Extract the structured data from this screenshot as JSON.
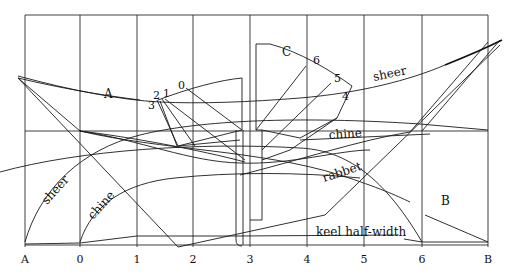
{
  "diagram": {
    "type": "boat lines drawing (half-breadth and body plan)",
    "stations": [
      "A",
      "0",
      "1",
      "2",
      "3",
      "4",
      "5",
      "6",
      "B"
    ],
    "curve_labels": {
      "sheer_upper": "sheer",
      "sheer_lower": "sheer",
      "chine_upper": "chine",
      "chine_lower": "chine",
      "rabbet": "rabbet",
      "keel_half_width": "keel half-width",
      "diagonal_a": "A",
      "diagonal_b": "B",
      "diagonal_c": "C"
    },
    "section_numbers": {
      "forward": [
        "0",
        "1",
        "2",
        "3"
      ],
      "aft": [
        "4",
        "5",
        "6"
      ]
    },
    "colors": {
      "line": "#1a1a1a",
      "background": "#ffffff"
    }
  }
}
